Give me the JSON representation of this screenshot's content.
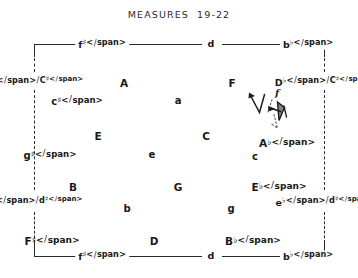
{
  "figure": {
    "title": "MEASURES  19-22",
    "ink_color": "#1a1a1a",
    "background_color": "#ffffff"
  },
  "frame": {
    "top_border_style": "solid",
    "bottom_border_style": "solid",
    "left_border_style": "dashed",
    "right_border_style": "dashed",
    "top_labels": [
      "f♯",
      "d",
      "b♭"
    ],
    "bottom_labels": [
      "f♯",
      "d",
      "b♭"
    ],
    "left_labels": [
      "D♭/C♯",
      "e♭/d♯"
    ],
    "right_labels": [
      "D♭/C♯",
      "e♭/d♯"
    ]
  },
  "lattice": {
    "rows": [
      {
        "row_index": 0,
        "kind": "major",
        "cells": [
          {
            "label": "A",
            "x": 124,
            "y": 83
          },
          {
            "label": "F",
            "x": 232,
            "y": 83
          }
        ]
      },
      {
        "row_index": 1,
        "kind": "minor",
        "cells": [
          {
            "label": "c♯",
            "x": 77,
            "y": 101
          },
          {
            "label": "a",
            "x": 178,
            "y": 101
          }
        ]
      },
      {
        "row_index": 2,
        "kind": "major",
        "cells": [
          {
            "label": "E",
            "x": 98,
            "y": 136
          },
          {
            "label": "C",
            "x": 206,
            "y": 136
          },
          {
            "label": "A♭",
            "x": 287,
            "y": 143
          }
        ]
      },
      {
        "row_index": 3,
        "kind": "minor",
        "cells": [
          {
            "label": "g♯",
            "x": 50,
            "y": 155
          },
          {
            "label": "e",
            "x": 152,
            "y": 155
          },
          {
            "label": "c",
            "x": 255,
            "y": 157
          }
        ]
      },
      {
        "row_index": 4,
        "kind": "major",
        "cells": [
          {
            "label": "B",
            "x": 73,
            "y": 187
          },
          {
            "label": "G",
            "x": 178,
            "y": 187
          },
          {
            "label": "E♭",
            "x": 279,
            "y": 187
          }
        ]
      },
      {
        "row_index": 5,
        "kind": "minor",
        "cells": [
          {
            "label": "b",
            "x": 127,
            "y": 209
          },
          {
            "label": "g",
            "x": 231,
            "y": 209
          }
        ]
      },
      {
        "row_index": 6,
        "kind": "major",
        "cells": [
          {
            "label": "F♯",
            "x": 52,
            "y": 241
          },
          {
            "label": "D",
            "x": 154,
            "y": 241
          },
          {
            "label": "B♭",
            "x": 253,
            "y": 241
          }
        ]
      }
    ]
  },
  "annotation": {
    "name": "voice-leading-arrow-cluster",
    "style": "hand-drawn-pen",
    "solid_stroke_color": "#1c1c1c",
    "dotted_stroke_color": "#6e6e6e",
    "label": "f",
    "arrow_count": 3
  }
}
